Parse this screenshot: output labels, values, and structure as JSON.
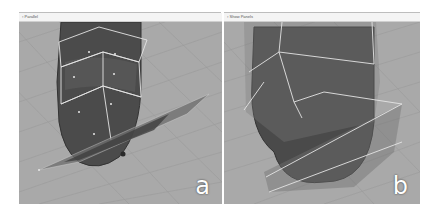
{
  "figure": {
    "panels": [
      {
        "id": "a",
        "title": "Parallel",
        "label": "a",
        "description": "3D viewport: dark capsule-shaped mesh with white wireframe control cage, intersected by a thin translucent slanted plane; small dark sphere below the plane"
      },
      {
        "id": "b",
        "title": "Show  Panels",
        "label": "b",
        "description": "3D viewport: dark egg-shaped mesh enclosed by translucent polygonal cage with white edges"
      }
    ],
    "colors": {
      "background": "#a9a9a9",
      "grid": "#9a9a9a",
      "mesh": "#4a4a4a",
      "cage_edge": "#e6e6e6",
      "label": "#ffffff"
    }
  }
}
